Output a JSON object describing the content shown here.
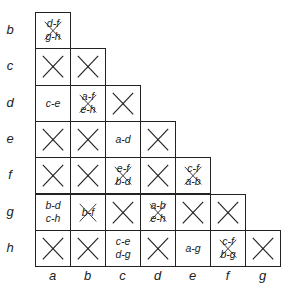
{
  "diagram": {
    "type": "implication-table",
    "row_labels": [
      "b",
      "c",
      "d",
      "e",
      "f",
      "g",
      "h"
    ],
    "col_labels": [
      "a",
      "b",
      "c",
      "d",
      "e",
      "f",
      "g"
    ],
    "rows": [
      {
        "state": "b",
        "cells": [
          {
            "col": "a",
            "kind": "pairs-crossed",
            "pairs": [
              "d-f",
              "g-h"
            ]
          }
        ]
      },
      {
        "state": "c",
        "cells": [
          {
            "col": "a",
            "kind": "x"
          },
          {
            "col": "b",
            "kind": "x"
          }
        ]
      },
      {
        "state": "d",
        "cells": [
          {
            "col": "a",
            "kind": "pairs",
            "pairs": [
              "c-e"
            ]
          },
          {
            "col": "b",
            "kind": "pairs-crossed",
            "pairs": [
              "a-f",
              "e-h"
            ]
          },
          {
            "col": "c",
            "kind": "x"
          }
        ]
      },
      {
        "state": "e",
        "cells": [
          {
            "col": "a",
            "kind": "x"
          },
          {
            "col": "b",
            "kind": "x"
          },
          {
            "col": "c",
            "kind": "pairs",
            "pairs": [
              "a-d"
            ]
          },
          {
            "col": "d",
            "kind": "x"
          }
        ]
      },
      {
        "state": "f",
        "cells": [
          {
            "col": "a",
            "kind": "x"
          },
          {
            "col": "b",
            "kind": "x"
          },
          {
            "col": "c",
            "kind": "pairs-crossed",
            "pairs": [
              "e-f",
              "b-d"
            ]
          },
          {
            "col": "d",
            "kind": "x"
          },
          {
            "col": "e",
            "kind": "pairs-crossed",
            "pairs": [
              "c-f",
              "a-b"
            ]
          }
        ]
      },
      {
        "state": "g",
        "cells": [
          {
            "col": "a",
            "kind": "pairs",
            "pairs": [
              "b-d",
              "c-h"
            ]
          },
          {
            "col": "b",
            "kind": "pairs-crossed",
            "pairs": [
              "b-f"
            ]
          },
          {
            "col": "c",
            "kind": "x"
          },
          {
            "col": "d",
            "kind": "pairs-crossed",
            "pairs": [
              "a-b",
              "e-h"
            ]
          },
          {
            "col": "e",
            "kind": "x"
          },
          {
            "col": "f",
            "kind": "x"
          }
        ]
      },
      {
        "state": "h",
        "cells": [
          {
            "col": "a",
            "kind": "x"
          },
          {
            "col": "b",
            "kind": "x"
          },
          {
            "col": "c",
            "kind": "pairs",
            "pairs": [
              "c-e",
              "d-g"
            ]
          },
          {
            "col": "d",
            "kind": "x"
          },
          {
            "col": "e",
            "kind": "pairs",
            "pairs": [
              "a-g"
            ]
          },
          {
            "col": "f",
            "kind": "pairs-crossed",
            "pairs": [
              "c-f",
              "b-g"
            ]
          },
          {
            "col": "g",
            "kind": "x"
          }
        ]
      }
    ],
    "colors": {
      "line": "#222222",
      "background": "#ffffff"
    }
  }
}
